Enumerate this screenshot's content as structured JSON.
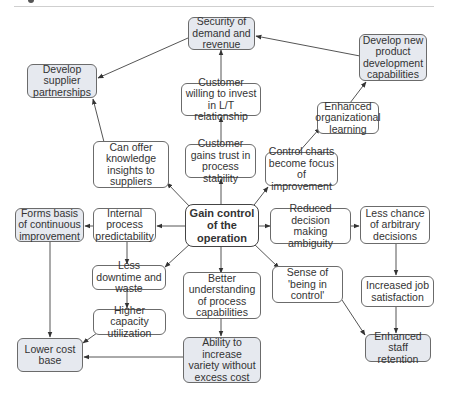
{
  "diagram": {
    "type": "influence-map",
    "central_node": "Gain control of the operation",
    "colors": {
      "shaded_fill": "#e6e9ef",
      "plain_fill": "#ffffff",
      "border": "#6b6b6b",
      "arrow": "#444444"
    },
    "nodes": {
      "security": "Security of demand and revenue",
      "new_product": "Develop new product development capabilities",
      "supplier": "Develop supplier partnerships",
      "customer_invest": "Customer willing to invest in L/T relationship",
      "org_learning": "Enhanced organizational learning",
      "knowledge": "Can offer knowledge insights to suppliers",
      "customer_trust": "Customer gains trust in process stability",
      "control_charts": "Control charts become focus of improvement",
      "core": "Gain control of the operation",
      "continuous": "Forms basis of continuous improvement",
      "predictability": "Internal process predictability",
      "ambiguity": "Reduced decision making ambiguity",
      "arbitrary": "Less chance of arbitrary decisions",
      "downtime": "Less downtime and waste",
      "understanding": "Better understanding of process capabilities",
      "sense_control": "Sense of 'being in control'",
      "job_satisfaction": "Increased job satisfaction",
      "capacity": "Higher capacity utilization",
      "lower_cost": "Lower cost base",
      "variety": "Ability to increase variety without excess cost",
      "staff_retention": "Enhanced staff retention"
    },
    "edges": [
      [
        "core",
        "customer_trust"
      ],
      [
        "core",
        "knowledge"
      ],
      [
        "core",
        "control_charts"
      ],
      [
        "core",
        "predictability"
      ],
      [
        "core",
        "ambiguity"
      ],
      [
        "core",
        "downtime"
      ],
      [
        "core",
        "understanding"
      ],
      [
        "core",
        "sense_control"
      ],
      [
        "customer_trust",
        "customer_invest"
      ],
      [
        "customer_invest",
        "security"
      ],
      [
        "knowledge",
        "supplier"
      ],
      [
        "security",
        "supplier"
      ],
      [
        "new_product",
        "security"
      ],
      [
        "control_charts",
        "org_learning"
      ],
      [
        "org_learning",
        "new_product"
      ],
      [
        "predictability",
        "continuous"
      ],
      [
        "predictability",
        "downtime"
      ],
      [
        "downtime",
        "capacity"
      ],
      [
        "capacity",
        "lower_cost"
      ],
      [
        "continuous",
        "lower_cost"
      ],
      [
        "understanding",
        "variety"
      ],
      [
        "variety",
        "lower_cost"
      ],
      [
        "ambiguity",
        "arbitrary"
      ],
      [
        "arbitrary",
        "job_satisfaction"
      ],
      [
        "job_satisfaction",
        "staff_retention"
      ],
      [
        "sense_control",
        "staff_retention"
      ]
    ]
  }
}
